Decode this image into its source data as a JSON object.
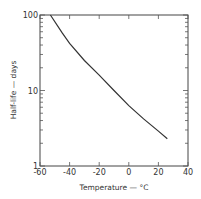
{
  "chart_data": {
    "type": "line",
    "title": "",
    "xlabel": "Temperature — °C",
    "ylabel": "Half-life — days",
    "xlim": [
      -60,
      40
    ],
    "ylim": [
      1,
      100
    ],
    "yscale": "log",
    "grid": false,
    "x_ticks": [
      -60,
      -40,
      -20,
      0,
      20,
      40
    ],
    "x_tick_labels": [
      "-60",
      "-40",
      "-20",
      "0",
      "20",
      "40"
    ],
    "y_ticks": [
      1,
      10,
      100
    ],
    "y_tick_labels": [
      "1",
      "10",
      "100"
    ],
    "series": [
      {
        "name": "Half-life",
        "x": [
          -53,
          -45,
          -40,
          -30,
          -20,
          -10,
          0,
          10,
          20,
          26
        ],
        "y": [
          100,
          58,
          42,
          25,
          16,
          10,
          6.3,
          4.2,
          2.9,
          2.3
        ]
      }
    ]
  }
}
